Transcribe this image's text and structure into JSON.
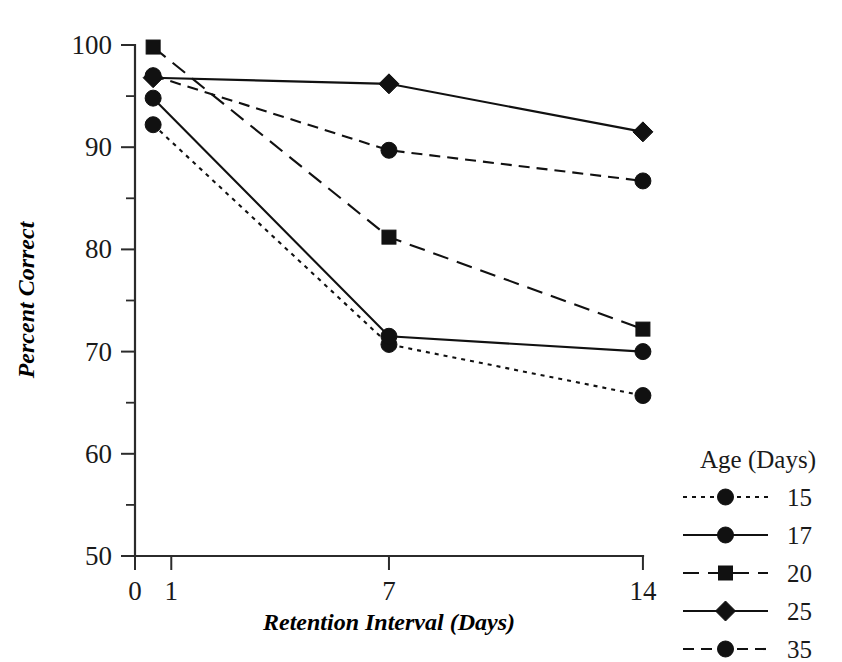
{
  "chart_data": {
    "type": "line",
    "title": "",
    "xlabel": "Retention Interval (Days)",
    "ylabel": "Percent Correct",
    "xlim": [
      0,
      14.6
    ],
    "ylim": [
      50,
      100
    ],
    "xticks": [
      "0",
      "1",
      "7",
      "14"
    ],
    "xtick_values": [
      0,
      1,
      7,
      14
    ],
    "yticks": [
      "50",
      "60",
      "70",
      "80",
      "90",
      "100"
    ],
    "ytick_values": [
      50,
      60,
      70,
      80,
      90,
      100
    ],
    "yminor_values": [
      55,
      65,
      75,
      85,
      95
    ],
    "grid": false,
    "legend_position": "right",
    "legend_title": "Age (Days)",
    "x": [
      0.5,
      7,
      14
    ],
    "series": [
      {
        "name": "15",
        "label": "15",
        "linestyle": "dotted",
        "marker": "circle",
        "values": [
          92.2,
          70.7,
          65.7
        ]
      },
      {
        "name": "17",
        "label": "17",
        "linestyle": "solid",
        "marker": "circle",
        "values": [
          94.8,
          71.5,
          70.0
        ]
      },
      {
        "name": "20",
        "label": "20",
        "linestyle": "longdash",
        "marker": "square",
        "values": [
          99.8,
          81.2,
          72.2
        ]
      },
      {
        "name": "25",
        "label": "25",
        "linestyle": "solid",
        "marker": "diamond",
        "values": [
          96.8,
          96.2,
          91.5
        ]
      },
      {
        "name": "35",
        "label": "35",
        "linestyle": "dashed",
        "marker": "circle",
        "values": [
          97.0,
          89.7,
          86.7
        ]
      }
    ]
  },
  "colors": {
    "ink": "#111111",
    "axis": "#2b2b2b",
    "background": "#ffffff"
  }
}
